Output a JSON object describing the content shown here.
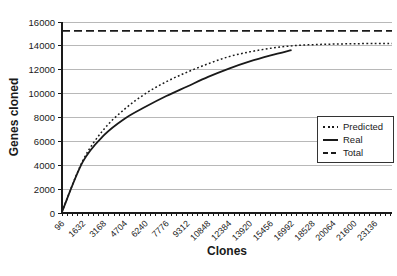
{
  "figure": {
    "background": "#ffffff",
    "line_color": "#1a1a1a",
    "grid_color": "#b8b8b8"
  },
  "chart_data": {
    "type": "line",
    "title": "",
    "xlabel": "Clones",
    "ylabel": "Genes cloned",
    "xlim": [
      96,
      24384
    ],
    "ylim": [
      0,
      16000
    ],
    "grid": "horizontal",
    "legend_position": "right",
    "y_ticks": [
      0,
      2000,
      4000,
      6000,
      8000,
      10000,
      12000,
      14000,
      16000
    ],
    "x_minor_tick_step": 384,
    "x_categories": [
      96,
      1632,
      3168,
      4704,
      6240,
      7776,
      9312,
      10848,
      12384,
      13920,
      15456,
      16992,
      18528,
      20064,
      21600,
      23136
    ],
    "series": [
      {
        "name": "Predicted",
        "style": "dotted",
        "x": [
          96,
          1632,
          3168,
          4704,
          6240,
          7776,
          9312,
          10848,
          12384,
          13920,
          15456,
          16992,
          18528,
          20064,
          21600,
          23136,
          24384
        ],
        "values": [
          100,
          4400,
          7000,
          8700,
          10000,
          11000,
          11800,
          12500,
          13100,
          13500,
          13800,
          14000,
          14100,
          14150,
          14180,
          14200,
          14200
        ]
      },
      {
        "name": "Real",
        "style": "solid",
        "x": [
          96,
          1632,
          3168,
          4704,
          6240,
          7776,
          9312,
          10848,
          12384,
          13920,
          15456,
          16992
        ],
        "values": [
          100,
          4300,
          6500,
          7900,
          8900,
          9800,
          10600,
          11400,
          12100,
          12700,
          13200,
          13650
        ]
      },
      {
        "name": "Total",
        "style": "dashed",
        "x": [
          96,
          24384
        ],
        "values": [
          15250,
          15250
        ]
      }
    ]
  }
}
